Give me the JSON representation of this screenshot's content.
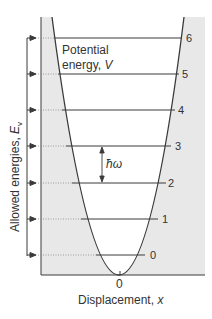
{
  "diagram": {
    "y_axis_label": "Allowed energies, ",
    "y_axis_symbol": "E",
    "y_axis_subscript": "v",
    "x_axis_label": "Displacement, ",
    "x_axis_symbol": "x",
    "origin_label": "0",
    "curve_label_line1": "Potential",
    "curve_label_line2": "energy, ",
    "curve_label_symbol": "V",
    "spacing_label": "ħω",
    "levels": [
      {
        "v": "0"
      },
      {
        "v": "1"
      },
      {
        "v": "2"
      },
      {
        "v": "3"
      },
      {
        "v": "4"
      },
      {
        "v": "5"
      },
      {
        "v": "6"
      }
    ],
    "colors": {
      "shade": "#e8e8e8",
      "line": "#3a3a3a",
      "text": "#333333",
      "dotted": "#888888"
    }
  }
}
